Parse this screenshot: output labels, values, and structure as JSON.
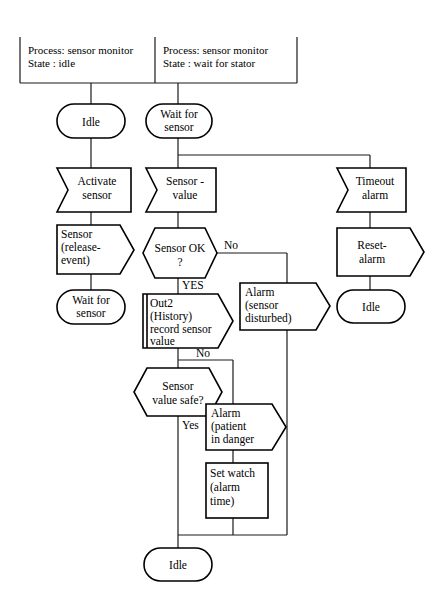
{
  "diagram": {
    "headers": [
      {
        "id": "hdr-left",
        "line1": "Process: sensor monitor",
        "line2": "State : idle"
      },
      {
        "id": "hdr-right",
        "line1": "Process: sensor monitor",
        "line2": "State : wait for stator"
      }
    ],
    "nodes": [
      {
        "id": "state-idle-left",
        "shape": "state",
        "lines": [
          "Idle"
        ]
      },
      {
        "id": "state-wait-for-sensor",
        "shape": "state",
        "lines": [
          "Wait for",
          "sensor"
        ]
      },
      {
        "id": "input-activate-sensor",
        "shape": "input",
        "lines": [
          "Activate",
          "sensor"
        ]
      },
      {
        "id": "output-sensor-release",
        "shape": "output",
        "lines": [
          "Sensor",
          "(release-",
          "event)"
        ]
      },
      {
        "id": "state-wait-for-sensor-2",
        "shape": "state",
        "lines": [
          "Wait for",
          "sensor"
        ]
      },
      {
        "id": "input-sensor-value",
        "shape": "input",
        "lines": [
          "Sensor -",
          "value"
        ]
      },
      {
        "id": "decision-sensor-ok",
        "shape": "decision",
        "lines": [
          "Sensor OK",
          "?"
        ]
      },
      {
        "id": "output-out2-history",
        "shape": "output-bar",
        "lines": [
          "Out2",
          "(History)",
          "record sensor",
          "value"
        ]
      },
      {
        "id": "decision-sensor-value-safe",
        "shape": "decision",
        "lines": [
          "Sensor",
          "value safe?"
        ]
      },
      {
        "id": "output-alarm-sensor-disturbed",
        "shape": "output",
        "lines": [
          "Alarm",
          "(sensor",
          "disturbed)"
        ]
      },
      {
        "id": "output-alarm-patient-danger",
        "shape": "output",
        "lines": [
          "Alarm",
          "(patient",
          "in danger"
        ]
      },
      {
        "id": "task-set-watch",
        "shape": "task",
        "lines": [
          "Set watch",
          "(alarm",
          "time)"
        ]
      },
      {
        "id": "input-timeout-alarm",
        "shape": "input",
        "lines": [
          "Timeout",
          "alarm"
        ]
      },
      {
        "id": "output-reset-alarm",
        "shape": "output",
        "lines": [
          "Reset-",
          "alarm"
        ]
      },
      {
        "id": "state-idle-right",
        "shape": "state",
        "lines": [
          "Idle"
        ]
      },
      {
        "id": "state-idle-bottom",
        "shape": "state",
        "lines": [
          "Idle"
        ]
      }
    ],
    "edge_labels": [
      {
        "id": "lbl-sensor-ok-no",
        "text": "No"
      },
      {
        "id": "lbl-sensor-ok-yes",
        "text": "YES"
      },
      {
        "id": "lbl-value-safe-no",
        "text": "No"
      },
      {
        "id": "lbl-value-safe-yes",
        "text": "Yes"
      }
    ],
    "colors": {
      "stroke": "#000000",
      "background": "#ffffff",
      "connector": "#1a1a1a"
    }
  }
}
